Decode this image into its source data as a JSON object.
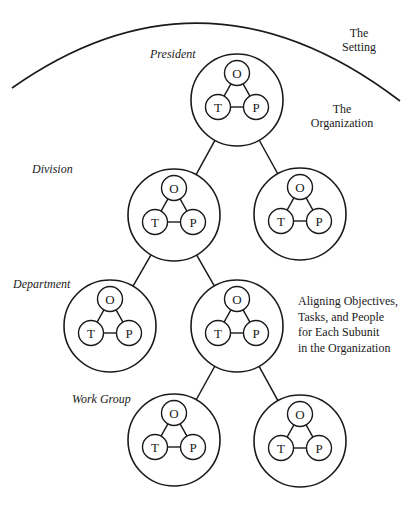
{
  "diagram": {
    "title_partial": "",
    "setting_label": [
      "The",
      "Setting"
    ],
    "organization_label": [
      "The",
      "Organization"
    ],
    "side_note": [
      "Aligning Objectives,",
      "Tasks, and People",
      "for Each Subunit",
      "in the Organization"
    ],
    "levels": {
      "president": "President",
      "division": "Division",
      "department": "Department",
      "work_group": "Work Group"
    },
    "node_letters": {
      "objectives": "O",
      "tasks": "T",
      "people": "P"
    },
    "nodes": [
      {
        "id": "president",
        "level": "President",
        "cx": 237,
        "cy": 100,
        "r": 46
      },
      {
        "id": "division-left",
        "level": "Division",
        "cx": 174,
        "cy": 215,
        "r": 46
      },
      {
        "id": "division-right",
        "level": "Division",
        "cx": 300,
        "cy": 214,
        "r": 46
      },
      {
        "id": "department-left",
        "level": "Department",
        "cx": 110,
        "cy": 326,
        "r": 46
      },
      {
        "id": "department-right",
        "level": "Department",
        "cx": 237,
        "cy": 326,
        "r": 46
      },
      {
        "id": "workgroup-left",
        "level": "Work Group",
        "cx": 174,
        "cy": 440,
        "r": 46
      },
      {
        "id": "workgroup-right",
        "level": "Work Group",
        "cx": 300,
        "cy": 441,
        "r": 46
      }
    ],
    "edges": [
      [
        "president",
        "division-left"
      ],
      [
        "president",
        "division-right"
      ],
      [
        "division-left",
        "department-left"
      ],
      [
        "division-left",
        "department-right"
      ],
      [
        "department-right",
        "workgroup-left"
      ],
      [
        "department-right",
        "workgroup-right"
      ]
    ],
    "colors": {
      "stroke": "#1a1a1a",
      "background": "#ffffff"
    }
  }
}
